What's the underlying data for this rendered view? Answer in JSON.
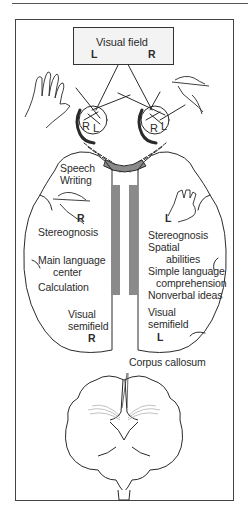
{
  "visual_field": {
    "title": "Visual field",
    "left": "L",
    "right": "R"
  },
  "eyes": {
    "left_eye": {
      "left_label": "R",
      "right_label": "L"
    },
    "right_eye": {
      "left_label": "R",
      "right_label": "L"
    }
  },
  "left_hemisphere": {
    "hand_label": "R",
    "functions": [
      "Speech",
      "Writing",
      "Stereognosis",
      "Main language",
      "center",
      "Calculation"
    ],
    "visual": [
      "Visual",
      "semifield"
    ],
    "visual_side": "R"
  },
  "right_hemisphere": {
    "hand_label": "L",
    "functions": [
      "Stereognosis",
      "Spatial",
      "abilities",
      "Simple language",
      "comprehension",
      "Nonverbal ideas"
    ],
    "visual": [
      "Visual",
      "semifield"
    ],
    "visual_side": "L"
  },
  "coronal_section": {
    "label": "Corpus callosum"
  },
  "colors": {
    "line": "#2a2a2a",
    "corpus_callosum_gray": "#8a8a8a",
    "box_fill": "#f3f3f3"
  }
}
